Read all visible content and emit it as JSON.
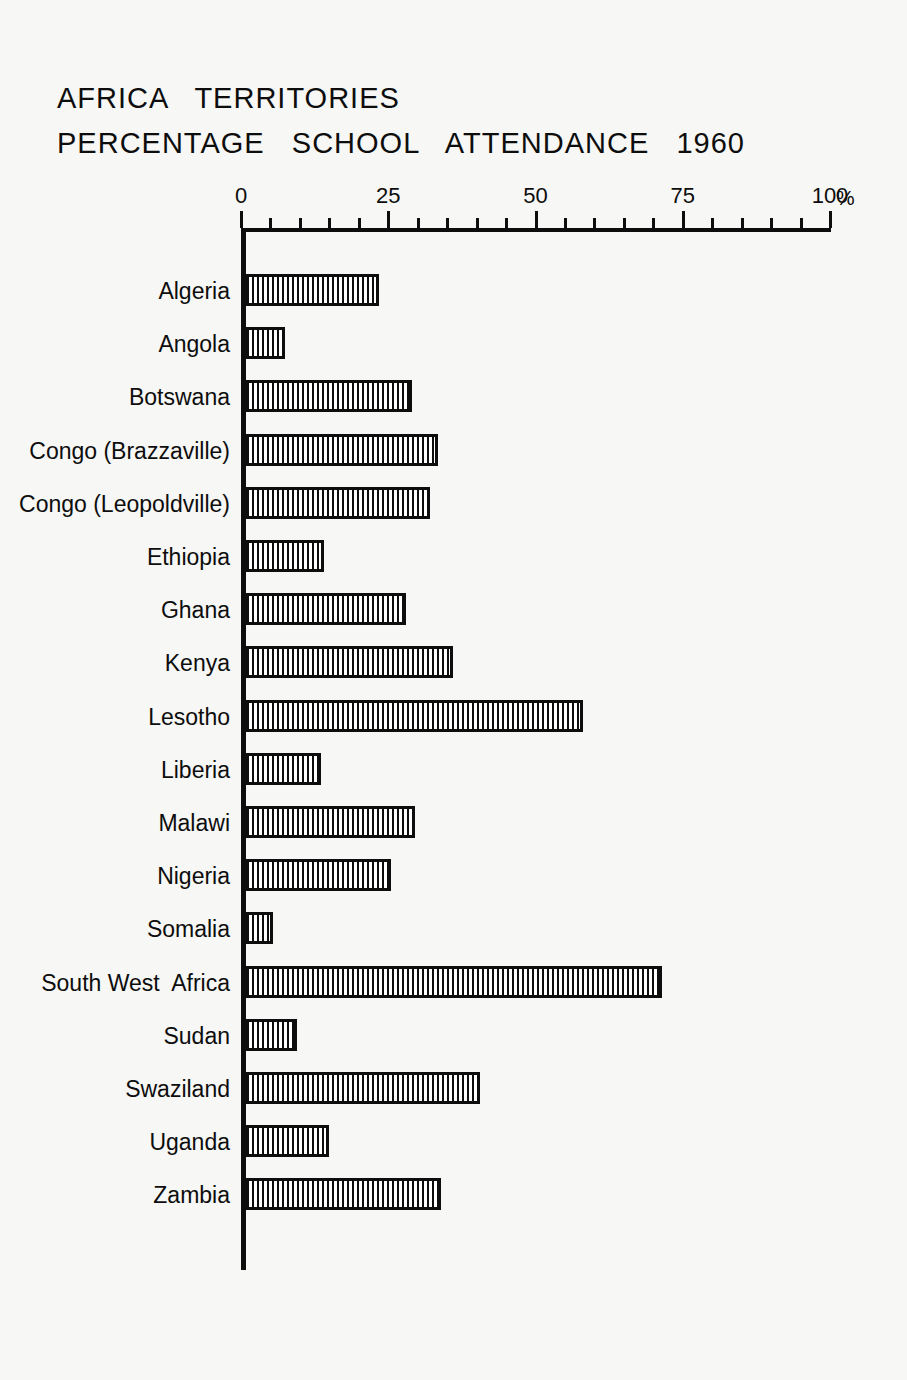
{
  "title": {
    "line1": "AFRICA   TERRITORIES",
    "line2": "PERCENTAGE   SCHOOL   ATTENDANCE   1960"
  },
  "axis": {
    "unit_symbol": "%",
    "tick_labels": [
      "0",
      "25",
      "50",
      "75",
      "100"
    ],
    "tick_values": [
      0,
      25,
      50,
      75,
      100
    ],
    "minor_step": 5
  },
  "chart_data": {
    "type": "bar",
    "orientation": "horizontal",
    "title": "AFRICA TERRITORIES PERCENTAGE SCHOOL ATTENDANCE 1960",
    "subtitle": "",
    "xlabel": "%",
    "ylabel": "",
    "xlim": [
      0,
      100
    ],
    "grid": false,
    "legend": "none",
    "categories": [
      "Algeria",
      "Angola",
      "Botswana",
      "Congo (Brazzaville)",
      "Congo (Leopoldville)",
      "Ethiopia",
      "Ghana",
      "Kenya",
      "Lesotho",
      "Liberia",
      "Malawi",
      "Nigeria",
      "Somalia",
      "South West  Africa",
      "Sudan",
      "Swaziland",
      "Uganda",
      "Zambia"
    ],
    "values": [
      23,
      7,
      28.5,
      33,
      31.5,
      13.5,
      27.5,
      35.5,
      57.5,
      13,
      29,
      25,
      5,
      71,
      9,
      40,
      14.5,
      33.5
    ]
  }
}
